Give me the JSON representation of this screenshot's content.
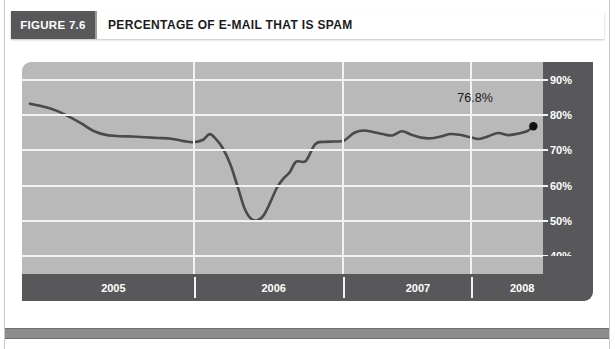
{
  "figure": {
    "tag_label": "FIGURE 7.6",
    "title": "PERCENTAGE OF E-MAIL THAT IS SPAM"
  },
  "colors": {
    "tag_background": "#58585a",
    "plot_background": "#b9b9b9",
    "gridline": "#f2f2f2",
    "series_line": "#4a4a4a",
    "axis_strip": "#58585a",
    "endpoint_marker": "#111111",
    "footer_bar": "#8d8d8d"
  },
  "chart_data": {
    "type": "line",
    "title": "PERCENTAGE OF E-MAIL THAT IS SPAM",
    "xlabel": "",
    "ylabel": "",
    "ylim": [
      35,
      95
    ],
    "xlim": [
      2004.83,
      2008.08
    ],
    "grid": true,
    "legend": false,
    "y_ticks": [
      "40%",
      "50%",
      "60%",
      "70%",
      "80%",
      "90%"
    ],
    "y_tick_values": [
      40,
      50,
      60,
      70,
      80,
      90
    ],
    "x_ticks": [
      "2005",
      "2006",
      "2007",
      "2008"
    ],
    "x_tick_values": [
      2005.4,
      2006.4,
      2007.3,
      2007.95
    ],
    "x_tick_separators": [
      2005.9,
      2006.83,
      2007.63
    ],
    "annotations": [
      {
        "text": "76.8%",
        "x": 2007.82,
        "y": 84.5
      }
    ],
    "endpoint_marker": {
      "x": 2008.02,
      "y": 76.8,
      "label": "76.8%"
    },
    "series": [
      {
        "name": "Spam share of e-mail",
        "x": [
          2004.88,
          2004.96,
          2005.04,
          2005.12,
          2005.2,
          2005.28,
          2005.36,
          2005.44,
          2005.52,
          2005.6,
          2005.68,
          2005.76,
          2005.84,
          2005.9,
          2005.96,
          2006.0,
          2006.04,
          2006.08,
          2006.13,
          2006.18,
          2006.22,
          2006.26,
          2006.3,
          2006.34,
          2006.38,
          2006.42,
          2006.46,
          2006.5,
          2006.54,
          2006.6,
          2006.66,
          2006.72,
          2006.78,
          2006.84,
          2006.9,
          2006.96,
          2007.02,
          2007.08,
          2007.14,
          2007.2,
          2007.26,
          2007.32,
          2007.38,
          2007.44,
          2007.5,
          2007.56,
          2007.62,
          2007.68,
          2007.74,
          2007.8,
          2007.86,
          2007.92,
          2007.98,
          2008.02
        ],
        "y": [
          83.2,
          82.4,
          81.3,
          79.6,
          77.6,
          75.4,
          74.3,
          74.0,
          73.9,
          73.7,
          73.5,
          73.3,
          72.6,
          72.3,
          73.0,
          74.6,
          73.2,
          70.8,
          66.0,
          59.0,
          53.4,
          50.6,
          50.2,
          51.8,
          55.4,
          59.4,
          62.0,
          63.8,
          66.8,
          67.0,
          71.8,
          72.4,
          72.5,
          72.8,
          74.9,
          75.6,
          75.2,
          74.6,
          74.2,
          75.4,
          74.4,
          73.6,
          73.4,
          73.9,
          74.6,
          74.4,
          73.8,
          73.2,
          74.0,
          74.9,
          74.3,
          74.7,
          75.4,
          76.8
        ]
      }
    ]
  }
}
